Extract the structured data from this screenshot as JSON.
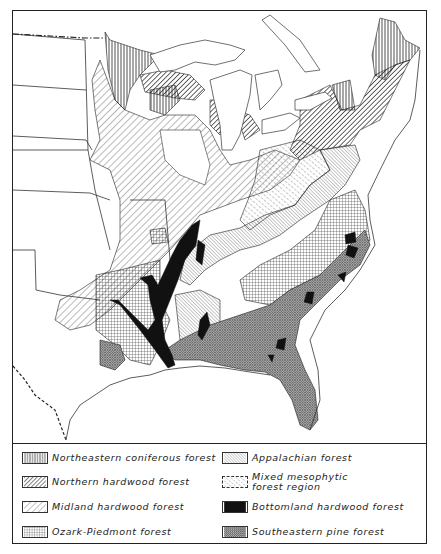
{
  "map": {
    "title": "Forest regions of the eastern United States",
    "regions": [
      {
        "id": "northeastern-coniferous",
        "pattern": "vertical-lines"
      },
      {
        "id": "northern-hardwood",
        "pattern": "dense-diagonal"
      },
      {
        "id": "midland-hardwood",
        "pattern": "sparse-diagonal"
      },
      {
        "id": "ozark-piedmont",
        "pattern": "grid"
      },
      {
        "id": "appalachian",
        "pattern": "fine-back-diagonal"
      },
      {
        "id": "mixed-mesophytic",
        "pattern": "dashed-diagonal"
      },
      {
        "id": "bottomland-hardwood",
        "pattern": "solid-black"
      },
      {
        "id": "southeastern-pine",
        "pattern": "crosshatch-stipple"
      }
    ]
  },
  "legend": {
    "items": [
      {
        "label": "Northeastern coniferous forest",
        "pattern": "vertical-lines"
      },
      {
        "label": "Northern hardwood forest",
        "pattern": "dense-diagonal"
      },
      {
        "label": "Midland hardwood forest",
        "pattern": "sparse-diagonal"
      },
      {
        "label": "Ozark-Piedmont forest",
        "pattern": "grid"
      },
      {
        "label": "Appalachian forest",
        "pattern": "fine-back-diagonal"
      },
      {
        "label": "Mixed mesophytic forest region",
        "pattern": "dashed-diagonal"
      },
      {
        "label": "Bottomland hardwood forest",
        "pattern": "solid-black"
      },
      {
        "label": "Southeastern pine forest",
        "pattern": "crosshatch-stipple"
      }
    ]
  },
  "colors": {
    "ink": "#222222",
    "paper": "#ffffff"
  }
}
